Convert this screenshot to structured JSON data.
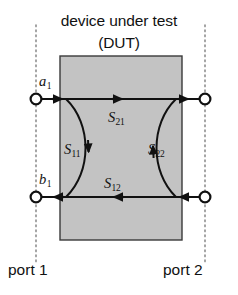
{
  "figure": {
    "title_line_1": "device under test",
    "title_line_2": "(DUT)",
    "dut_block_color": "#c3c3c3",
    "dut_border_color": "#3a3a3a",
    "line_color": "#111111",
    "reference_plane_color": "#8d8d8d",
    "terminal_fill": "#ffffff"
  },
  "ports": {
    "left_caption": "port 1",
    "right_caption": "port 2"
  },
  "waves": {
    "incident_label": "a",
    "incident_subscript": "1",
    "reflected_label": "b",
    "reflected_subscript": "1"
  },
  "s_parameters": {
    "s21": {
      "symbol": "S",
      "subscript": "21"
    },
    "s11": {
      "symbol": "S",
      "subscript": "11"
    },
    "s22": {
      "symbol": "S",
      "subscript": "22"
    },
    "s12": {
      "symbol": "S",
      "subscript": "12"
    }
  },
  "geometry": {
    "canvas_width": 238,
    "canvas_height": 295,
    "dut_rect": {
      "x": 60,
      "y": 56,
      "width": 122,
      "height": 184
    },
    "top_wire_y": 99,
    "bottom_wire_y": 197,
    "left_plane_x": 36,
    "right_plane_x": 205,
    "terminal_radius": 5.4
  }
}
